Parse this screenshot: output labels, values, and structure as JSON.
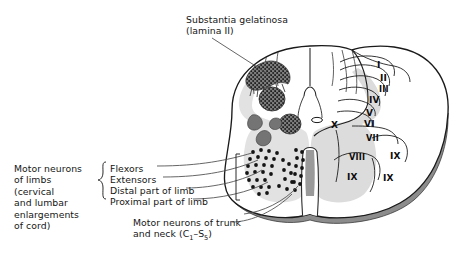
{
  "figure": {
    "title_label": "Substantia gelatinosa\n(lamina II)",
    "labels": {
      "substantia_gelatinosa": "Substantia gelatinosa",
      "substantia_gelatinosa_line2": "(lamina II)",
      "motor_neurons_limbs": "Motor neurons\nof limbs\n(cervical\nand lumbar\nenlargements\nof cord)",
      "flexors": "Flexors",
      "extensors": "Extensors",
      "distal_part_of_limb": "Distal part of limb",
      "proximal_part_of_limb": "Proximal part of limb",
      "motor_neurons_trunk_line1": "Motor neurons of trunk",
      "motor_neurons_trunk_line2_pre": "and neck (C",
      "motor_neurons_trunk_sub1": "1",
      "motor_neurons_trunk_mid": "–S",
      "motor_neurons_trunk_sub2": "5",
      "motor_neurons_trunk_post": ")"
    },
    "laminae": [
      {
        "numeral": "I",
        "x": 377,
        "y": 60
      },
      {
        "numeral": "II",
        "x": 380,
        "y": 73
      },
      {
        "numeral": "III",
        "x": 379,
        "y": 84
      },
      {
        "numeral": "IV",
        "x": 369,
        "y": 95
      },
      {
        "numeral": "V",
        "x": 366,
        "y": 108
      },
      {
        "numeral": "VI",
        "x": 364,
        "y": 119
      },
      {
        "numeral": "VII",
        "x": 366,
        "y": 133
      },
      {
        "numeral": "VIII",
        "x": 349,
        "y": 152
      },
      {
        "numeral": "IX",
        "x": 390,
        "y": 151
      },
      {
        "numeral": "IX",
        "x": 347,
        "y": 172
      },
      {
        "numeral": "IX",
        "x": 383,
        "y": 173
      },
      {
        "numeral": "X",
        "x": 331,
        "y": 120
      }
    ],
    "colors": {
      "outline": "#1a1a1a",
      "white_matter": "#ffffff",
      "grey_matter": "#e2e2e2",
      "grey_matter_right": "#dcdcdc",
      "nucleus_dark": "#6e6e6e",
      "pia_band": "#8c8c8c",
      "neuron_dot": "#141414",
      "leader_line": "#4a4a4a",
      "text": "#161616"
    }
  }
}
